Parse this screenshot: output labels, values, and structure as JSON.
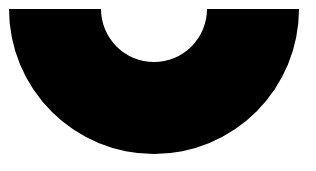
{
  "shape": {
    "type": "half-annulus",
    "fill": "#000000",
    "background": "#ffffff",
    "center_x": 154,
    "center_y": 9,
    "outer_radius": 145,
    "inner_radius": 53,
    "orientation": "opening-up"
  }
}
